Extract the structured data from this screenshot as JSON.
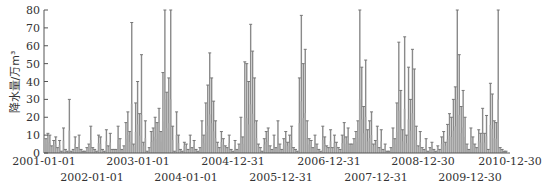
{
  "chart_data": {
    "type": "bar",
    "title": "",
    "xlabel": "",
    "ylabel": "降水量/万m³",
    "ylim": [
      0,
      80
    ],
    "yticks": [
      0,
      10,
      20,
      30,
      40,
      50,
      60,
      70,
      80
    ],
    "grid": false,
    "legend": null,
    "x_tick_labels_row1": [
      "2001-01-01",
      "2003-01-01",
      "2004-12-31",
      "2006-12-31",
      "2008-12-30",
      "2010-12-30"
    ],
    "x_tick_labels_row2": [
      "2002-01-01",
      "2004-01-01",
      "2005-12-31",
      "2007-12-31",
      "2009-12-30"
    ],
    "x_tick_order": [
      "2001-01-01",
      "2002-01-01",
      "2003-01-01",
      "2004-01-01",
      "2004-12-31",
      "2005-12-31",
      "2006-12-31",
      "2007-12-31",
      "2008-12-30",
      "2009-12-30",
      "2010-12-30"
    ],
    "series": [
      {
        "name": "降水量",
        "color": "#8a8a8a",
        "note": "Daily precipitation volume 2001-01-01 to 2010-12-30; values below are approximate peak readings sampled along the time axis (≈ every 10 days).",
        "values": [
          8,
          11,
          10,
          4,
          7,
          9,
          3,
          7,
          1,
          14,
          2,
          1,
          30,
          1,
          2,
          9,
          3,
          10,
          2,
          1,
          1,
          3,
          5,
          15,
          3,
          2,
          1,
          10,
          9,
          2,
          1,
          13,
          4,
          11,
          2,
          2,
          2,
          15,
          8,
          2,
          4,
          17,
          23,
          12,
          73,
          5,
          28,
          40,
          22,
          55,
          6,
          18,
          1,
          3,
          12,
          14,
          20,
          17,
          25,
          12,
          45,
          80,
          34,
          42,
          80,
          15,
          1,
          23,
          10,
          2,
          1,
          6,
          5,
          2,
          10,
          3,
          7,
          2,
          1,
          3,
          18,
          10,
          28,
          38,
          56,
          42,
          29,
          18,
          6,
          3,
          12,
          8,
          4,
          3,
          10,
          2,
          1,
          7,
          2,
          5,
          20,
          9,
          51,
          50,
          40,
          72,
          57,
          42,
          18,
          5,
          3,
          1,
          8,
          12,
          14,
          4,
          2,
          10,
          3,
          18,
          5,
          2,
          8,
          12,
          6,
          10,
          15,
          3,
          2,
          1,
          42,
          77,
          50,
          58,
          18,
          8,
          7,
          3,
          10,
          5,
          2,
          1,
          15,
          9,
          4,
          3,
          13,
          3,
          10,
          6,
          3,
          2,
          10,
          17,
          9,
          14,
          5,
          5,
          8,
          12,
          18,
          80,
          48,
          26,
          52,
          13,
          18,
          23,
          5,
          7,
          15,
          3,
          13,
          2,
          5,
          1,
          1,
          3,
          14,
          8,
          28,
          62,
          35,
          13,
          65,
          10,
          48,
          30,
          58,
          47,
          15,
          4,
          12,
          3,
          2,
          8,
          1,
          3,
          6,
          2,
          1,
          4,
          2,
          9,
          12,
          6,
          16,
          22,
          20,
          30,
          37,
          80,
          55,
          26,
          35,
          20,
          5,
          2,
          14,
          9,
          5,
          3,
          13,
          11,
          25,
          11,
          21,
          2,
          39,
          33,
          18,
          17,
          80,
          3,
          2,
          1,
          1
        ]
      }
    ],
    "date_range": [
      "2001-01-01",
      "2010-12-30"
    ]
  },
  "axes": {
    "y_title": "降水量/万m³"
  }
}
